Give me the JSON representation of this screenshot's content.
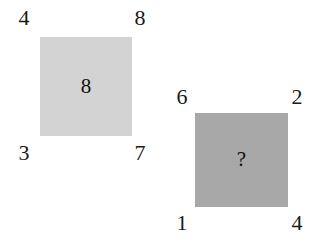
{
  "canvas": {
    "width": 313,
    "height": 250,
    "background_color": "#ffffff"
  },
  "puzzle": {
    "type": "number-square-analogy",
    "figures": [
      {
        "id": "figure-1",
        "fill_color": "#d3d3d3",
        "center_value": "8",
        "corners": {
          "top_left": "4",
          "top_right": "8",
          "bottom_left": "3",
          "bottom_right": "7"
        }
      },
      {
        "id": "figure-2",
        "fill_color": "#a8a8a8",
        "center_value": "?",
        "corners": {
          "top_left": "6",
          "top_right": "2",
          "bottom_left": "1",
          "bottom_right": "4"
        }
      }
    ]
  }
}
